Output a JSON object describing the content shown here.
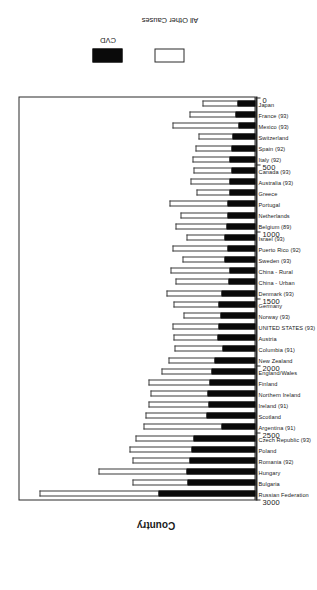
{
  "chart_data": {
    "type": "bar",
    "subtype": "stacked-bar",
    "title": "",
    "xlabel": "Country",
    "ylabel": "",
    "ylim": [
      0,
      3000
    ],
    "yticks": [
      0,
      500,
      1000,
      1500,
      2000,
      2500,
      3000
    ],
    "ytick_labels": [
      "0",
      "500",
      "1000",
      "1500",
      "2000",
      "2500",
      "3000"
    ],
    "grid": false,
    "legend_position": "right",
    "orientation": "rotated-90",
    "categories": [
      "Russian Federation",
      "Bulgaria",
      "Hungary",
      "Romania (92)",
      "Poland",
      "Czech Republic (93)",
      "Argentina (91)",
      "Scotland",
      "Ireland (91)",
      "Northern Ireland",
      "Finland",
      "England/Wales",
      "New Zealand",
      "Columbia (91)",
      "Austria",
      "UNITED STATES (93)",
      "Norway (93)",
      "Germany",
      "Denmark (93)",
      "China - Urban",
      "China - Rural",
      "Sweden (93)",
      "Puerto Rico (92)",
      "Israel (93)",
      "Belgium (89)",
      "Netherlands",
      "Portugal",
      "Greece",
      "Australia (93)",
      "Canada (93)",
      "Italy (92)",
      "Spain (92)",
      "Switzerland",
      "Mexico (93)",
      "France (93)",
      "Japan"
    ],
    "series": [
      {
        "name": "CVD",
        "color": "#0a0a0a",
        "values": [
          1230,
          860,
          880,
          840,
          820,
          790,
          430,
          620,
          600,
          610,
          590,
          560,
          520,
          420,
          480,
          470,
          450,
          470,
          430,
          340,
          330,
          400,
          360,
          400,
          370,
          350,
          350,
          330,
          330,
          310,
          330,
          300,
          290,
          220,
          250,
          230
        ]
      },
      {
        "name": "All Other Causes",
        "color": "#ffffff",
        "values": [
          1520,
          700,
          1120,
          720,
          780,
          730,
          1000,
          780,
          760,
          720,
          770,
          640,
          580,
          610,
          560,
          590,
          470,
          570,
          700,
          680,
          750,
          530,
          700,
          480,
          650,
          600,
          740,
          420,
          500,
          480,
          470,
          460,
          430,
          830,
          590,
          450
        ]
      }
    ],
    "totals": [
      2750,
      1560,
      2000,
      1560,
      1600,
      1520,
      1430,
      1400,
      1360,
      1330,
      1360,
      1200,
      1100,
      1030,
      1040,
      1060,
      920,
      1040,
      1130,
      1020,
      1080,
      930,
      1060,
      880,
      1020,
      950,
      1090,
      750,
      830,
      790,
      800,
      760,
      720,
      1050,
      840,
      680
    ]
  },
  "legend": {
    "items": [
      {
        "label": "CVD",
        "color": "#0a0a0a"
      },
      {
        "label": "All Other Causes",
        "color": "#ffffff"
      }
    ]
  },
  "axes": {
    "category_axis_title": "Country"
  }
}
